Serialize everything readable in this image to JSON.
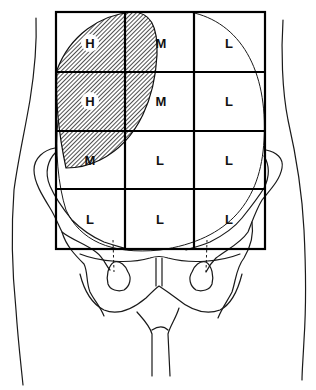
{
  "figure": {
    "grid": {
      "rows": 4,
      "cols": 3,
      "x_lines": [
        56,
        125,
        194,
        265
      ],
      "y_lines": [
        12,
        72,
        131,
        189,
        249
      ]
    },
    "cells": [
      {
        "row": 0,
        "col": 0,
        "label": "H",
        "circled": true
      },
      {
        "row": 0,
        "col": 1,
        "label": "M",
        "circled": false
      },
      {
        "row": 0,
        "col": 2,
        "label": "L",
        "circled": false
      },
      {
        "row": 1,
        "col": 0,
        "label": "H",
        "circled": true
      },
      {
        "row": 1,
        "col": 1,
        "label": "M",
        "circled": false
      },
      {
        "row": 1,
        "col": 2,
        "label": "L",
        "circled": false
      },
      {
        "row": 2,
        "col": 0,
        "label": "M",
        "circled": false
      },
      {
        "row": 2,
        "col": 1,
        "label": "L",
        "circled": false
      },
      {
        "row": 2,
        "col": 2,
        "label": "L",
        "circled": false
      },
      {
        "row": 3,
        "col": 0,
        "label": "L",
        "circled": false
      },
      {
        "row": 3,
        "col": 1,
        "label": "L",
        "circled": false
      },
      {
        "row": 3,
        "col": 2,
        "label": "L",
        "circled": false
      }
    ],
    "legend_codes": {
      "H": "High",
      "M": "Medium",
      "L": "Low"
    },
    "hatched_region": "upper-left lens-shaped zone covering H cells",
    "colors": {
      "line": "#000000",
      "background": "#ffffff"
    }
  }
}
